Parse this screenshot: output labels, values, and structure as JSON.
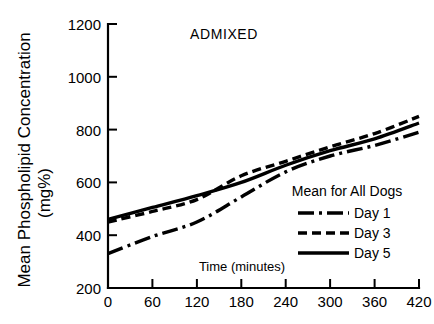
{
  "chart_data": {
    "type": "line",
    "title": "ADMIXED",
    "xlabel": "Time (minutes)",
    "ylabel": "Mean Phospholipid Concentration (mg%)",
    "ylabel_line1": "Mean Phospholipid Concentration",
    "ylabel_line2": "(mg%)",
    "xlim": [
      0,
      420
    ],
    "ylim": [
      200,
      1200
    ],
    "xticks": [
      0,
      60,
      120,
      180,
      240,
      300,
      360,
      420
    ],
    "yticks": [
      200,
      400,
      600,
      800,
      1000,
      1200
    ],
    "xtick_labels": [
      "0",
      "60",
      "120",
      "180",
      "240",
      "300",
      "360",
      "420"
    ],
    "ytick_labels": [
      "200",
      "400",
      "600",
      "800",
      "1000",
      "1200"
    ],
    "grid": false,
    "legend_position": "inside-lower-right",
    "legend_title": "Mean for All Dogs",
    "x": [
      0,
      60,
      120,
      180,
      240,
      300,
      360,
      420
    ],
    "series": [
      {
        "name": "Day 1",
        "style": "dash-dot",
        "color": "#000000",
        "values": [
          330,
          395,
          450,
          545,
          640,
          700,
          740,
          790
        ]
      },
      {
        "name": "Day 3",
        "style": "dashed",
        "color": "#000000",
        "values": [
          450,
          490,
          535,
          625,
          680,
          735,
          785,
          850
        ]
      },
      {
        "name": "Day 5",
        "style": "solid",
        "color": "#000000",
        "values": [
          460,
          505,
          550,
          600,
          665,
          720,
          765,
          825
        ]
      }
    ]
  },
  "legend": {
    "title": "Mean for All Dogs",
    "items": [
      {
        "label": "Day 1",
        "style": "dash-dot"
      },
      {
        "label": "Day 3",
        "style": "dashed"
      },
      {
        "label": "Day 5",
        "style": "solid"
      }
    ]
  },
  "axes": {
    "x_title": "Time (minutes)",
    "y_title_line1": "Mean Phospholipid Concentration",
    "y_title_line2": "(mg%)"
  }
}
